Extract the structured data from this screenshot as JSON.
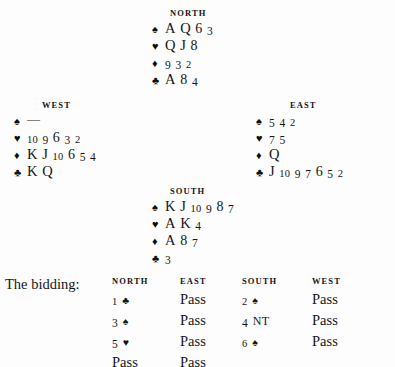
{
  "diagram": {
    "type": "bridge-deal",
    "suit_glyphs": {
      "spade": "♠",
      "heart": "♥",
      "diamond": "♦",
      "club": "♣"
    },
    "hands": {
      "north": {
        "label": "NORTH",
        "suits": [
          {
            "suit": "spade",
            "glyph": "♠",
            "ranks": "A Q 6 3"
          },
          {
            "suit": "heart",
            "glyph": "♥",
            "ranks": "Q J 8"
          },
          {
            "suit": "diamond",
            "glyph": "♦",
            "ranks": "9 3 2"
          },
          {
            "suit": "club",
            "glyph": "♣",
            "ranks": "A 8 4"
          }
        ]
      },
      "west": {
        "label": "WEST",
        "suits": [
          {
            "suit": "spade",
            "glyph": "♠",
            "ranks": "—"
          },
          {
            "suit": "heart",
            "glyph": "♥",
            "ranks": "10 9 6 3 2"
          },
          {
            "suit": "diamond",
            "glyph": "♦",
            "ranks": "K J 10 6 5 4"
          },
          {
            "suit": "club",
            "glyph": "♣",
            "ranks": "K Q"
          }
        ]
      },
      "east": {
        "label": "EAST",
        "suits": [
          {
            "suit": "spade",
            "glyph": "♠",
            "ranks": "5 4 2"
          },
          {
            "suit": "heart",
            "glyph": "♥",
            "ranks": "7 5"
          },
          {
            "suit": "diamond",
            "glyph": "♦",
            "ranks": "Q"
          },
          {
            "suit": "club",
            "glyph": "♣",
            "ranks": "J 10 9 7 6 5 2"
          }
        ]
      },
      "south": {
        "label": "SOUTH",
        "suits": [
          {
            "suit": "spade",
            "glyph": "♠",
            "ranks": "K J 10 9 8 7"
          },
          {
            "suit": "heart",
            "glyph": "♥",
            "ranks": "A K 4"
          },
          {
            "suit": "diamond",
            "glyph": "♦",
            "ranks": "A 8 7"
          },
          {
            "suit": "club",
            "glyph": "♣",
            "ranks": "3"
          }
        ]
      }
    }
  },
  "bidding": {
    "caption": "The bidding:",
    "headers": [
      "NORTH",
      "EAST",
      "SOUTH",
      "WEST"
    ],
    "rows": [
      [
        {
          "kind": "bid",
          "level": "1",
          "strain": "club",
          "glyph": "♣",
          "text": "1 ♣"
        },
        {
          "kind": "pass",
          "text": "Pass"
        },
        {
          "kind": "bid",
          "level": "2",
          "strain": "spade",
          "glyph": "♠",
          "text": "2 ♠"
        },
        {
          "kind": "pass",
          "text": "Pass"
        }
      ],
      [
        {
          "kind": "bid",
          "level": "3",
          "strain": "spade",
          "glyph": "♠",
          "text": "3 ♠"
        },
        {
          "kind": "pass",
          "text": "Pass"
        },
        {
          "kind": "bid",
          "level": "4",
          "strain": "NT",
          "glyph": "NT",
          "text": "4 NT"
        },
        {
          "kind": "pass",
          "text": "Pass"
        }
      ],
      [
        {
          "kind": "bid",
          "level": "5",
          "strain": "heart",
          "glyph": "♥",
          "text": "5 ♥"
        },
        {
          "kind": "pass",
          "text": "Pass"
        },
        {
          "kind": "bid",
          "level": "6",
          "strain": "spade",
          "glyph": "♠",
          "text": "6 ♠"
        },
        {
          "kind": "pass",
          "text": "Pass"
        }
      ],
      [
        {
          "kind": "pass",
          "text": "Pass"
        },
        {
          "kind": "pass",
          "text": "Pass"
        },
        {
          "kind": "empty",
          "text": ""
        },
        {
          "kind": "empty",
          "text": ""
        }
      ]
    ],
    "contract": "6 ♠ by South"
  },
  "colors": {
    "background": "#fdfdfd",
    "ink": "#161616",
    "suit_ink": "#0d0d0d"
  }
}
